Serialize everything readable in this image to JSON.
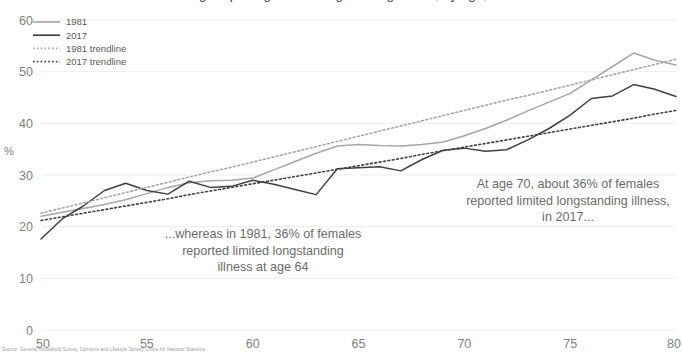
{
  "chart_data": {
    "type": "line",
    "title": "Percentage reporting limited longstanding illness, by age, females",
    "xlabel": "",
    "ylabel": "%",
    "xlim": [
      50,
      80
    ],
    "ylim": [
      0,
      60
    ],
    "xticks": [
      50,
      55,
      60,
      65,
      70,
      75,
      80
    ],
    "yticks": [
      0,
      10,
      20,
      30,
      40,
      50,
      60
    ],
    "grid": "horizontal",
    "legend_position": "top-left",
    "x": [
      50,
      51,
      52,
      53,
      54,
      55,
      56,
      57,
      58,
      59,
      60,
      61,
      62,
      63,
      64,
      65,
      66,
      67,
      68,
      69,
      70,
      71,
      72,
      73,
      74,
      75,
      76,
      77,
      78,
      79,
      80
    ],
    "series": [
      {
        "name": "1981",
        "color": "#a6a6a6",
        "style": "solid",
        "values": [
          22.0,
          22.8,
          23.5,
          24.3,
          25.2,
          26.4,
          27.6,
          28.5,
          28.9,
          29.0,
          29.4,
          31.0,
          32.6,
          34.2,
          35.6,
          35.9,
          35.7,
          35.6,
          35.9,
          36.4,
          37.6,
          39.0,
          40.6,
          42.4,
          44.1,
          45.8,
          48.4,
          51.0,
          53.6,
          52.2,
          51.3
        ]
      },
      {
        "name": "2017",
        "color": "#404040",
        "style": "solid",
        "values": [
          17.6,
          21.5,
          24.0,
          27.0,
          28.4,
          27.0,
          26.3,
          28.8,
          27.6,
          27.8,
          29.0,
          28.2,
          27.2,
          26.2,
          31.2,
          31.4,
          31.6,
          30.8,
          33.0,
          34.8,
          35.2,
          34.6,
          34.9,
          36.8,
          39.0,
          41.6,
          44.8,
          45.3,
          47.5,
          46.6,
          45.2
        ]
      },
      {
        "name": "1981 trendline",
        "color": "#a6a6a6",
        "style": "dotted",
        "values": [
          22.6,
          23.6,
          24.6,
          25.6,
          26.6,
          27.6,
          28.6,
          29.6,
          30.6,
          31.5,
          32.5,
          33.5,
          34.5,
          35.5,
          36.5,
          37.5,
          38.5,
          39.5,
          40.5,
          41.5,
          42.5,
          43.5,
          44.5,
          45.4,
          46.4,
          47.4,
          48.4,
          49.4,
          50.4,
          51.4,
          52.4
        ]
      },
      {
        "name": "2017 trendline",
        "color": "#404040",
        "style": "dotted",
        "values": [
          21.2,
          21.9,
          22.6,
          23.3,
          24.0,
          24.7,
          25.4,
          26.2,
          26.9,
          27.6,
          28.3,
          29.0,
          29.7,
          30.4,
          31.1,
          31.8,
          32.5,
          33.2,
          34.0,
          34.7,
          35.4,
          36.1,
          36.8,
          37.5,
          38.2,
          38.9,
          39.6,
          40.3,
          41.0,
          41.8,
          42.5
        ]
      }
    ],
    "annotations": [
      {
        "id": "annotation-left",
        "text": "...whereas in 1981, 36% of females\nreported limited longstanding\nillness at age 64"
      },
      {
        "id": "annotation-right",
        "text": "At age 70, about 36% of females\nreported limited longstanding illness,\nin 2017..."
      }
    ],
    "source_note": "Source: General Household Survey, Opinions and Lifestyle Survey, Office for National Statistics"
  },
  "legend": {
    "items": [
      {
        "label": "1981"
      },
      {
        "label": "2017"
      },
      {
        "label": "1981 trendline"
      },
      {
        "label": "2017 trendline"
      }
    ]
  },
  "colors": {
    "series_1981": "#a6a6a6",
    "series_2017": "#404040",
    "gridline": "#ededed",
    "tick_text": "#7f7f7f",
    "annotation_text": "#6b6b6b"
  }
}
